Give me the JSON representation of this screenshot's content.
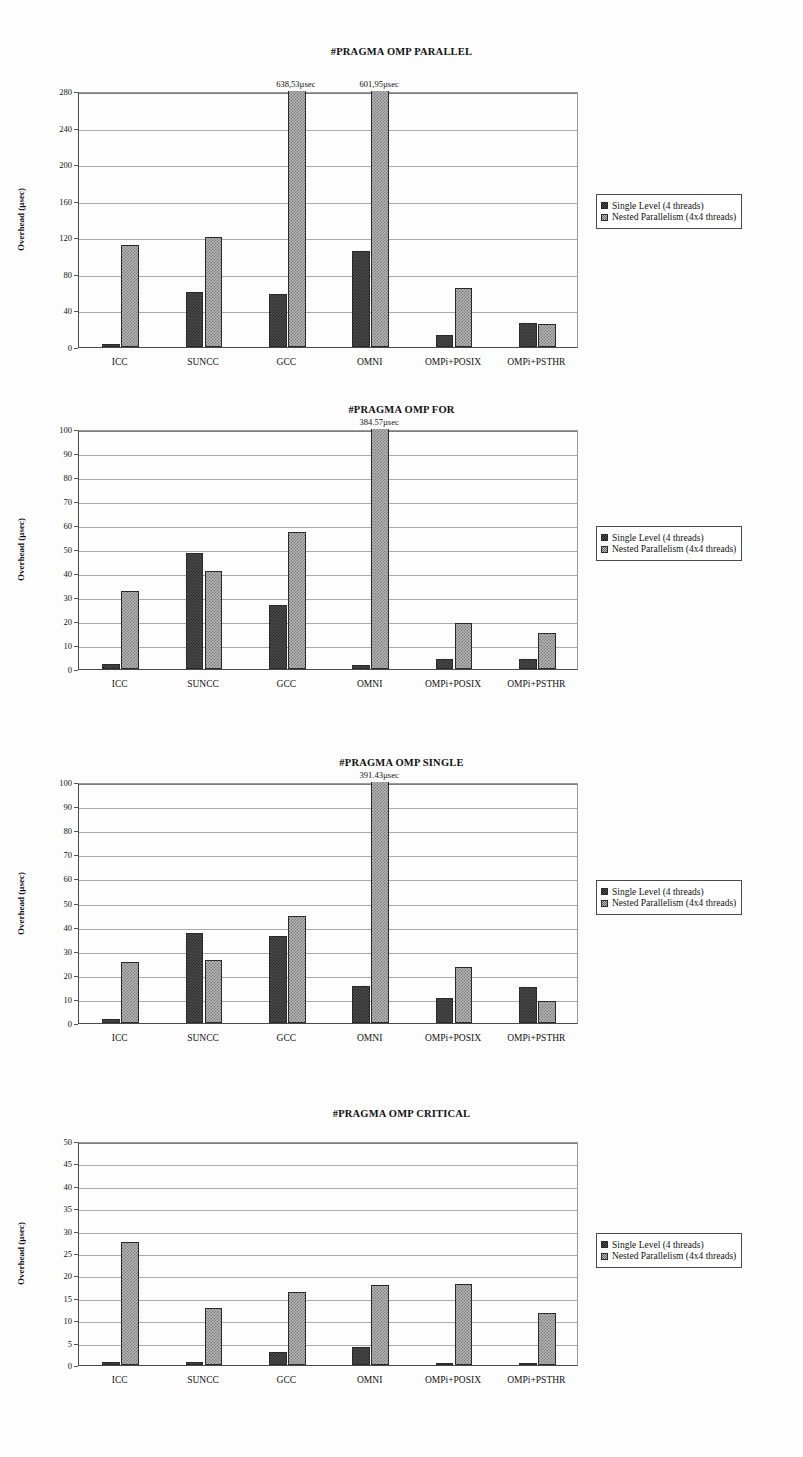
{
  "page": {
    "background": "#fdfdfd",
    "width": 803,
    "height": 1457
  },
  "legend": {
    "series": [
      {
        "label": "Single Level (4 threads)",
        "key": "single",
        "swatch": "dark-checker-swatch",
        "color": "#4c4c4c"
      },
      {
        "label": "Nested Parallelism (4x4 threads)",
        "key": "nested",
        "swatch": "light-checker-swatch",
        "color": "#b6b6b6"
      }
    ]
  },
  "chart_data": [
    {
      "id": "parallel",
      "type": "bar",
      "title": "#PRAGMA OMP PARALLEL",
      "xlabel": "",
      "ylabel": "Overhead (µsec)",
      "ylim": [
        0,
        280
      ],
      "ystep": 40,
      "yticks": [
        0,
        40,
        80,
        120,
        160,
        200,
        240,
        280
      ],
      "grid": true,
      "legend_position": "right",
      "categories": [
        "ICC",
        "SUNCC",
        "GCC",
        "OMNI",
        "OMPi+POSIX",
        "OMPi+PSTHR"
      ],
      "series": [
        {
          "name": "Single Level (4 threads)",
          "values": [
            3,
            60,
            58,
            105,
            13,
            26
          ]
        },
        {
          "name": "Nested Parallelism (4x4 threads)",
          "values": [
            112,
            120,
            638.53,
            601.95,
            65,
            25
          ]
        }
      ],
      "annotations": [
        {
          "category": "GCC",
          "series": "Nested Parallelism (4x4 threads)",
          "text": "638,53µsec"
        },
        {
          "category": "OMNI",
          "series": "Nested Parallelism (4x4 threads)",
          "text": "601,95µsec"
        }
      ]
    },
    {
      "id": "for",
      "type": "bar",
      "title": "#PRAGMA OMP FOR",
      "xlabel": "",
      "ylabel": "Overhead (µsec)",
      "ylim": [
        0,
        100
      ],
      "ystep": 10,
      "yticks": [
        0,
        10,
        20,
        30,
        40,
        50,
        60,
        70,
        80,
        90,
        100
      ],
      "grid": true,
      "legend_position": "right",
      "categories": [
        "ICC",
        "SUNCC",
        "GCC",
        "OMNI",
        "OMPi+POSIX",
        "OMPi+PSTHR"
      ],
      "series": [
        {
          "name": "Single Level (4 threads)",
          "values": [
            2.2,
            48.5,
            26.5,
            1.5,
            4,
            4
          ]
        },
        {
          "name": "Nested Parallelism (4x4 threads)",
          "values": [
            32.5,
            41,
            57,
            384.57,
            19,
            15
          ]
        }
      ],
      "annotations": [
        {
          "category": "OMNI",
          "series": "Nested Parallelism (4x4 threads)",
          "text": "384.57µsec"
        }
      ]
    },
    {
      "id": "single",
      "type": "bar",
      "title": "#PRAGMA OMP SINGLE",
      "xlabel": "",
      "ylabel": "Overhead (µsec)",
      "ylim": [
        0,
        100
      ],
      "ystep": 10,
      "yticks": [
        0,
        10,
        20,
        30,
        40,
        50,
        60,
        70,
        80,
        90,
        100
      ],
      "grid": true,
      "legend_position": "right",
      "categories": [
        "ICC",
        "SUNCC",
        "GCC",
        "OMNI",
        "OMPi+POSIX",
        "OMPi+PSTHR"
      ],
      "series": [
        {
          "name": "Single Level (4 threads)",
          "values": [
            1.8,
            37.5,
            36,
            15.5,
            10.5,
            15
          ]
        },
        {
          "name": "Nested Parallelism (4x4 threads)",
          "values": [
            25.5,
            26,
            44.5,
            391.43,
            23.3,
            9.2
          ]
        }
      ],
      "annotations": [
        {
          "category": "OMNI",
          "series": "Nested Parallelism (4x4 threads)",
          "text": "391.43µsec"
        }
      ]
    },
    {
      "id": "critical",
      "type": "bar",
      "title": "#PRAGMA OMP CRITICAL",
      "xlabel": "",
      "ylabel": "Overhead (µsec)",
      "ylim": [
        0,
        50
      ],
      "ystep": 5,
      "yticks": [
        0,
        5,
        10,
        15,
        20,
        25,
        30,
        35,
        40,
        45,
        50
      ],
      "grid": true,
      "legend_position": "right",
      "categories": [
        "ICC",
        "SUNCC",
        "GCC",
        "OMNI",
        "OMPi+POSIX",
        "OMPi+PSTHR"
      ],
      "series": [
        {
          "name": "Single Level (4 threads)",
          "values": [
            0.7,
            0.7,
            3,
            4,
            0.3,
            0.2
          ]
        },
        {
          "name": "Nested Parallelism (4x4 threads)",
          "values": [
            27.5,
            12.7,
            16.3,
            17.9,
            18.1,
            11.6
          ]
        }
      ],
      "annotations": []
    }
  ],
  "layout": {
    "charts": [
      {
        "id": "parallel",
        "top": 40,
        "title_top": 46,
        "plot": {
          "left": 78,
          "top": 92,
          "width": 500,
          "height": 256
        },
        "legend": {
          "left": 596,
          "top": 194
        }
      },
      {
        "id": "for",
        "top": 400,
        "title_top": 404,
        "plot": {
          "left": 78,
          "top": 430,
          "width": 500,
          "height": 240
        },
        "legend": {
          "left": 596,
          "top": 526
        }
      },
      {
        "id": "single",
        "top": 752,
        "title_top": 757,
        "plot": {
          "left": 78,
          "top": 783,
          "width": 500,
          "height": 241
        },
        "legend": {
          "left": 596,
          "top": 880
        }
      },
      {
        "id": "critical",
        "top": 1104,
        "title_top": 1108,
        "plot": {
          "left": 78,
          "top": 1142,
          "width": 500,
          "height": 224
        },
        "legend": {
          "left": 596,
          "top": 1233
        }
      }
    ]
  }
}
